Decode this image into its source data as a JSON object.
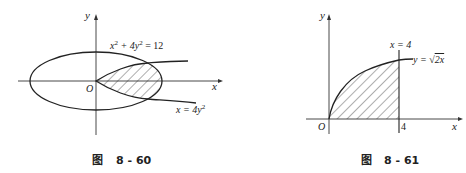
{
  "figures": [
    {
      "id": "fig-8-60",
      "caption_prefix": "图",
      "caption_number": "8 - 60",
      "axis_x_label": "x",
      "axis_y_label": "y",
      "origin_label": "O",
      "ellipse_label_html": "x²+4y²=12",
      "ellipse_label_parts": {
        "a": "x",
        "a_exp": "2",
        "b": " + 4y",
        "b_exp": "2",
        "c": " = 12"
      },
      "parabola_label_parts": {
        "a": "x = 4y",
        "a_exp": "2"
      },
      "shaded_region": "between parabola x=4y² and ellipse x²+4y²=12"
    },
    {
      "id": "fig-8-61",
      "caption_prefix": "图",
      "caption_number": "8 - 61",
      "axis_x_label": "x",
      "axis_y_label": "y",
      "origin_label": "O",
      "vline_label": "x = 4",
      "curve_label_prefix": "y = ",
      "curve_label_radicand": "2x",
      "x_tick_label": "4",
      "shaded_region": "under y=√(2x) from x=0 to x=4"
    }
  ]
}
